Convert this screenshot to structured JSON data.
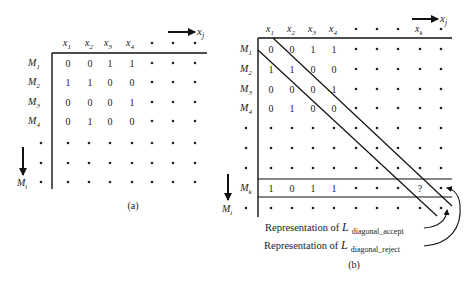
{
  "figure_a": {
    "caption": "(a)",
    "col_headers": [
      "x",
      "x",
      "x",
      "x"
    ],
    "col_subscripts": [
      "1",
      "2",
      "3",
      "4"
    ],
    "axis_x_label": "x",
    "axis_x_sub": "j",
    "row_labels": [
      "M",
      "M",
      "M",
      "M"
    ],
    "row_subscripts": [
      "1",
      "2",
      "3",
      "4"
    ],
    "axis_y_label": "M",
    "axis_y_sub": "i",
    "matrix": [
      [
        "0",
        "0",
        "1",
        "1"
      ],
      [
        "1",
        "1",
        "0",
        "0"
      ],
      [
        "0",
        "0",
        "0",
        "1"
      ],
      [
        "0",
        "1",
        "0",
        "0"
      ]
    ]
  },
  "figure_b": {
    "caption": "(b)",
    "col_headers": [
      "x",
      "x",
      "x",
      "x"
    ],
    "col_subscripts": [
      "1",
      "2",
      "3",
      "4"
    ],
    "col_k_label": "x",
    "col_k_sub": "k",
    "axis_x_label": "x",
    "axis_x_sub": "j",
    "row_labels": [
      "M",
      "M",
      "M",
      "M"
    ],
    "row_subscripts": [
      "1",
      "2",
      "3",
      "4"
    ],
    "row_k_label": "M",
    "row_k_sub": "k",
    "axis_y_label": "M",
    "axis_y_sub": "i",
    "matrix": [
      [
        "0",
        "0",
        "1",
        "1"
      ],
      [
        "1",
        "1",
        "0",
        "0"
      ],
      [
        "0",
        "0",
        "0",
        "1"
      ],
      [
        "0",
        "1",
        "0",
        "0"
      ]
    ],
    "row_k_values": [
      "1",
      "0",
      "1",
      "1"
    ],
    "unknown_cell": "?",
    "annotations": [
      {
        "prefix": "Representation of ",
        "symbol": "L",
        "subscript": "diagonal_accept"
      },
      {
        "prefix": "Representation of ",
        "symbol": "L",
        "subscript": "diagonal_reject"
      }
    ]
  }
}
